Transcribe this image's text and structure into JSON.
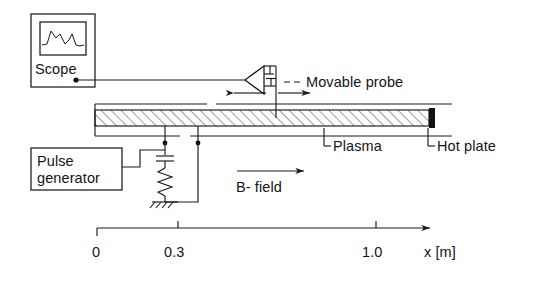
{
  "figure": {
    "kind": "plasma-experiment-schematic",
    "background_color": "#ffffff",
    "line_color": "#1a1a1a"
  },
  "instruments": {
    "scope": {
      "label": "Scope",
      "screen_icon": "waveform-icon"
    },
    "pulse_generator": {
      "label_line1": "Pulse",
      "label_line2": "generator"
    }
  },
  "annotations": {
    "movable_probe": "Movable probe",
    "plasma": "Plasma",
    "hot_plate": "Hot plate",
    "b_field": "B- field"
  },
  "axis": {
    "unit_label": "x [m]",
    "ticks": [
      {
        "value": "0",
        "pos": 0.0
      },
      {
        "value": "0.3",
        "pos": 0.3
      },
      {
        "value": "1.0",
        "pos": 1.0
      }
    ]
  },
  "symbols": {
    "probe_amplifier": "probe-amplifier-triangle-icon",
    "probe_capacitor": "capacitor-icon",
    "circuit_capacitor": "capacitor-icon",
    "circuit_resistor": "resistor-icon",
    "ground": "ground-icon",
    "arrow_left": "arrow-left-icon",
    "arrow_right": "arrow-right-icon",
    "b_field_arrow": "arrow-right-icon",
    "axis_arrow": "arrow-right-icon"
  }
}
